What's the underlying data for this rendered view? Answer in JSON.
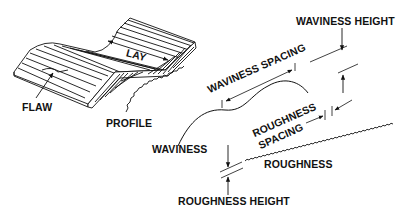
{
  "diagram": {
    "colors": {
      "ink": "#111111",
      "background": "#ffffff"
    },
    "labels": {
      "lay": "LAY",
      "flaw": "FLAW",
      "profile": "PROFILE",
      "waviness_height": "WAVINESS HEIGHT",
      "waviness_spacing": "WAVINESS SPACING",
      "waviness": "WAVINESS",
      "roughness_spacing_line1": "ROUGHNESS",
      "roughness_spacing_line2": "SPACING",
      "roughness": "ROUGHNESS",
      "roughness_height": "ROUGHNESS HEIGHT"
    }
  }
}
